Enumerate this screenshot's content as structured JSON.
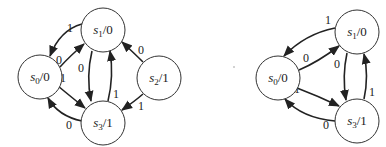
{
  "diagrams": [
    {
      "name": "left-state-diagram",
      "nodes": [
        {
          "id": "s0",
          "state": "s",
          "sub": "0",
          "output": "/0",
          "cx": 40,
          "cy": 77
        },
        {
          "id": "s1",
          "state": "s",
          "sub": "1",
          "output": "/0",
          "cx": 103,
          "cy": 30
        },
        {
          "id": "s2",
          "state": "s",
          "sub": "2",
          "output": "/1",
          "cx": 159,
          "cy": 78
        },
        {
          "id": "s3",
          "state": "s",
          "sub": "3",
          "output": "/1",
          "cx": 103,
          "cy": 123
        }
      ],
      "edges": [
        {
          "from": "s1",
          "to": "s0",
          "label": "1"
        },
        {
          "from": "s0",
          "to": "s1",
          "label": "0"
        },
        {
          "from": "s0",
          "to": "s3",
          "label": "1"
        },
        {
          "from": "s3",
          "to": "s0",
          "label": "0"
        },
        {
          "from": "s1",
          "to": "s3",
          "label": "0"
        },
        {
          "from": "s3",
          "to": "s1",
          "label": "1"
        },
        {
          "from": "s2",
          "to": "s1",
          "label": "0"
        },
        {
          "from": "s2",
          "to": "s3",
          "label": "1"
        }
      ]
    },
    {
      "name": "right-state-diagram",
      "nodes": [
        {
          "id": "s0",
          "state": "s",
          "sub": "0",
          "output": "/0",
          "cx": 278,
          "cy": 78
        },
        {
          "id": "s1",
          "state": "s",
          "sub": "1",
          "output": "/0",
          "cx": 357,
          "cy": 32
        },
        {
          "id": "s3",
          "state": "s",
          "sub": "3",
          "output": "/1",
          "cx": 357,
          "cy": 121
        }
      ],
      "edges": [
        {
          "from": "s1",
          "to": "s0",
          "label": "1"
        },
        {
          "from": "s0",
          "to": "s1",
          "label": "0"
        },
        {
          "from": "s0",
          "to": "s3",
          "label": "1"
        },
        {
          "from": "s3",
          "to": "s0",
          "label": "0"
        },
        {
          "from": "s1",
          "to": "s3",
          "label": "0"
        },
        {
          "from": "s3",
          "to": "s1",
          "label": "1"
        }
      ]
    }
  ],
  "labels": {
    "L": {
      "s0": {
        "state": "s",
        "sub": "0",
        "out": "/0"
      },
      "s1": {
        "state": "s",
        "sub": "1",
        "out": "/0"
      },
      "s2": {
        "state": "s",
        "sub": "2",
        "out": "/1"
      },
      "s3": {
        "state": "s",
        "sub": "3",
        "out": "/1"
      },
      "e_s1_s0": "1",
      "e_s0_s1": "0",
      "e_s0_s3": "1",
      "e_s3_s0": "0",
      "e_s1_s3": "0",
      "e_s3_s1": "1",
      "e_s2_s1": "0",
      "e_s2_s3": "1"
    },
    "R": {
      "s0": {
        "state": "s",
        "sub": "0",
        "out": "/0"
      },
      "s1": {
        "state": "s",
        "sub": "1",
        "out": "/0"
      },
      "s3": {
        "state": "s",
        "sub": "3",
        "out": "/1"
      },
      "e_s1_s0": "1",
      "e_s0_s1": "0",
      "e_s0_s3": "1",
      "e_s3_s0": "0",
      "e_s1_s3": "0",
      "e_s3_s1": "1"
    }
  }
}
